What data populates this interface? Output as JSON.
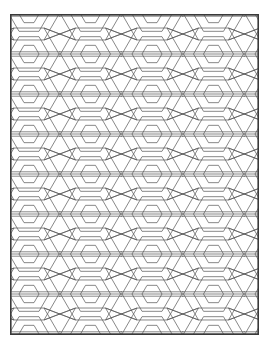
{
  "page": {
    "width": 267,
    "height": 348,
    "background_color": "#ffffff"
  },
  "sheet": {
    "name": "coloring-sheet",
    "x": 10,
    "y": 14,
    "width": 249,
    "height": 321,
    "fill_color": "#ffffff",
    "border_color": "#3a3a3a",
    "border_width": 1.6
  },
  "artwork": {
    "type": "hexagon-tessellation",
    "description": "Concentric flat-top hexagon rosettes tiled in a staggered honeycomb grid, clipped to the page border",
    "line_color": "#555555",
    "line_width": 0.7,
    "rings_per_cluster": 3,
    "ring_radii": [
      30,
      20,
      10
    ],
    "hex_orientation": "flat-top",
    "grid": {
      "column_spacing": 61.5,
      "row_spacing": 80,
      "row_offset": 40,
      "columns_x": [
        -42.5,
        19,
        80.5,
        142,
        203.5,
        265
      ],
      "rows_y": [
        -40,
        0,
        40,
        80,
        120,
        160,
        200,
        240,
        280,
        320,
        360
      ]
    },
    "connector_bars": {
      "enabled": true,
      "description": "Horizontal double-line bars joining neighbouring rosettes"
    }
  }
}
